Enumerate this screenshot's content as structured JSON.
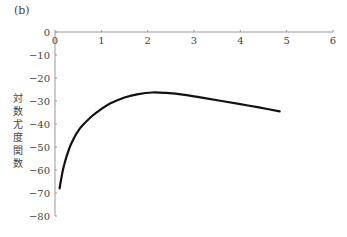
{
  "panel_label": "(b)",
  "chart_data": {
    "type": "line",
    "title": "",
    "xlabel": "",
    "ylabel": "対数尤度関数",
    "xlim": [
      0,
      6
    ],
    "ylim": [
      -80,
      0
    ],
    "x_ticks": [
      "0",
      "1",
      "2",
      "3",
      "4",
      "5",
      "6"
    ],
    "y_ticks": [
      "0",
      "−10",
      "−20",
      "−30",
      "−40",
      "−50",
      "−60",
      "−70",
      "−80"
    ],
    "grid": false,
    "legend": null,
    "series": [
      {
        "name": "log-likelihood",
        "color": "#111111",
        "x": [
          0.1,
          0.15,
          0.2,
          0.3,
          0.4,
          0.5,
          0.6,
          0.8,
          1.0,
          1.2,
          1.5,
          1.8,
          2.1,
          2.4,
          2.8,
          3.2,
          3.6,
          4.0,
          4.4,
          4.85
        ],
        "y": [
          -68,
          -62,
          -57.5,
          -51,
          -46.5,
          -43,
          -40.5,
          -36.5,
          -33.5,
          -31,
          -28.5,
          -27,
          -26.3,
          -26.5,
          -27.3,
          -28.6,
          -30,
          -31.4,
          -32.8,
          -34.5
        ]
      }
    ]
  }
}
